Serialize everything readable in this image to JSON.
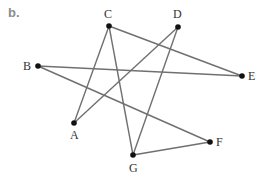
{
  "figure": {
    "part_label": "b.",
    "colors": {
      "edge": "#707070",
      "vertex": "#111111",
      "label": "#333333",
      "part_label": "#8c8c8c"
    }
  },
  "graph": {
    "vertices": [
      {
        "id": "A",
        "x": 74,
        "y": 123,
        "label_dx": -4,
        "label_dy": 16
      },
      {
        "id": "B",
        "x": 38,
        "y": 66,
        "label_dx": -15,
        "label_dy": 4
      },
      {
        "id": "C",
        "x": 109,
        "y": 26,
        "label_dx": -5,
        "label_dy": -8
      },
      {
        "id": "D",
        "x": 178,
        "y": 27,
        "label_dx": -5,
        "label_dy": -9
      },
      {
        "id": "E",
        "x": 242,
        "y": 76,
        "label_dx": 6,
        "label_dy": 4
      },
      {
        "id": "F",
        "x": 210,
        "y": 142,
        "label_dx": 6,
        "label_dy": 4
      },
      {
        "id": "G",
        "x": 133,
        "y": 155,
        "label_dx": -4,
        "label_dy": 17
      }
    ],
    "edges": [
      [
        "C",
        "A"
      ],
      [
        "C",
        "G"
      ],
      [
        "C",
        "E"
      ],
      [
        "D",
        "A"
      ],
      [
        "D",
        "G"
      ],
      [
        "B",
        "E"
      ],
      [
        "B",
        "F"
      ],
      [
        "G",
        "F"
      ]
    ]
  }
}
